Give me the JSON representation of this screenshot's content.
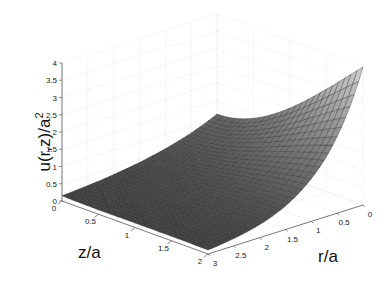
{
  "chart_data": {
    "type": "surface3d",
    "title": "",
    "xlabel": "z/a",
    "ylabel": "r/a",
    "zlabel": "u(r,z)/a^2",
    "zlabel_parts": {
      "base": "u(r,z)/a",
      "sup": "2"
    },
    "x_axis": {
      "name": "z/a",
      "range": [
        0,
        2
      ],
      "ticks": [
        "0",
        "0.5",
        "1",
        "1.5",
        "2"
      ]
    },
    "y_axis": {
      "name": "r/a",
      "range": [
        0,
        3
      ],
      "ticks": [
        "0",
        "0.5",
        "1",
        "1.5",
        "2",
        "2.5",
        "3"
      ]
    },
    "z_axis": {
      "name": "u(r,z)/a^2",
      "range": [
        0,
        4
      ],
      "ticks": [
        "0",
        "0.5",
        "1",
        "1.5",
        "2",
        "2.5",
        "3",
        "3.5",
        "4"
      ]
    },
    "grid": true,
    "colormap": "gray",
    "mesh_resolution": {
      "z_lines": 25,
      "r_lines": 37
    },
    "corner_values": [
      {
        "z": 0,
        "r": 0,
        "u": 1.1
      },
      {
        "z": 2,
        "r": 0,
        "u": 4.0
      },
      {
        "z": 0,
        "r": 3,
        "u": 0.0
      },
      {
        "z": 2,
        "r": 3,
        "u": 1.1
      }
    ]
  }
}
